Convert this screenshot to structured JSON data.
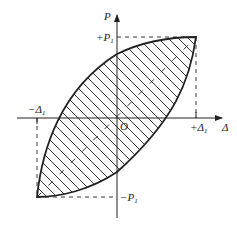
{
  "diagram": {
    "type": "hysteresis-loop",
    "axes": {
      "vertical_label": "P",
      "horizontal_label": "Δ",
      "origin_label": "O"
    },
    "tick_labels": {
      "p_pos": "+P",
      "p_pos_sub": "1",
      "p_neg": "−P",
      "p_neg_sub": "1",
      "d_pos": "+Δ",
      "d_pos_sub": "1",
      "d_neg": "−Δ",
      "d_neg_sub": "1"
    },
    "colors": {
      "line": "#222222",
      "background": "#ffffff"
    },
    "fill": "hatched"
  }
}
